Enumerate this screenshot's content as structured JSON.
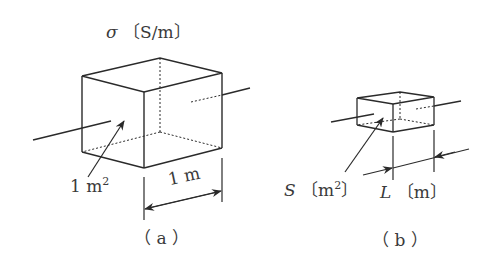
{
  "figure": {
    "panel_a": {
      "conductivity_label": "σ",
      "conductivity_unit": "〔S/m〕",
      "area_value": "1 m",
      "area_exp": "2",
      "length_label": "1 m",
      "caption": "（ a ）"
    },
    "panel_b": {
      "area_symbol": "S",
      "area_unit": "〔m",
      "area_exp": "2",
      "area_unit_close": "〕",
      "length_symbol": "L",
      "length_unit": "〔m〕",
      "caption": "（ b ）"
    },
    "colors": {
      "line": "#2a2a2a",
      "text": "#3a3a3a",
      "background": "#ffffff"
    }
  }
}
